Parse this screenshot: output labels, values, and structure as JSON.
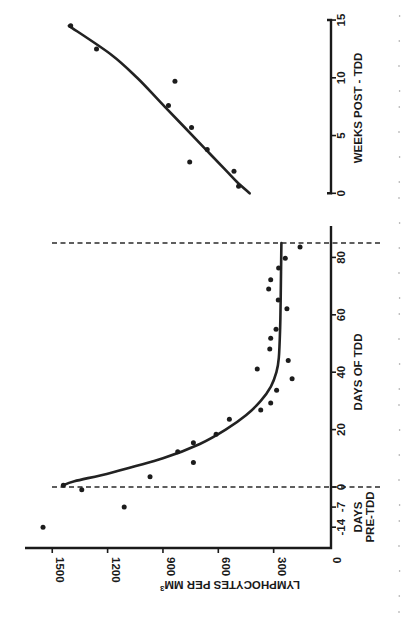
{
  "chart_data": [
    {
      "type": "scatter",
      "panel": "during-tdd",
      "orientation": "rotated 90deg clockwise (y-axis drawn horizontally at bottom)",
      "ylabel": "LYMPHOCYTES PER MM3",
      "ylabel_text": "LYMPHOCYTES PER MM",
      "ylabel_superscript": "3",
      "ylim": [
        0,
        1650
      ],
      "yticks": [
        0,
        300,
        600,
        900,
        1200,
        1500
      ],
      "xlabel": "DAYS OF TDD",
      "xlabel_pre_line1": "DAYS",
      "xlabel_pre_line2": "PRE-TDD",
      "xlim": [
        -16,
        88
      ],
      "xticks": [
        -14,
        -7,
        0,
        20,
        40,
        60,
        80
      ],
      "reference_lines": [
        {
          "axis": "x",
          "value": 0,
          "style": "dashed"
        },
        {
          "axis": "x",
          "value": 85,
          "style": "dashed"
        }
      ],
      "points": [
        {
          "x": -14,
          "y": 1550
        },
        {
          "x": -7,
          "y": 1110
        },
        {
          "x": -1,
          "y": 1340
        },
        {
          "x": 0.6,
          "y": 1440
        },
        {
          "x": 3.6,
          "y": 970
        },
        {
          "x": 8.5,
          "y": 735
        },
        {
          "x": 12.3,
          "y": 820
        },
        {
          "x": 15.4,
          "y": 735
        },
        {
          "x": 18.4,
          "y": 612
        },
        {
          "x": 23.6,
          "y": 540
        },
        {
          "x": 26.8,
          "y": 370
        },
        {
          "x": 29.3,
          "y": 316
        },
        {
          "x": 33.7,
          "y": 284
        },
        {
          "x": 37.7,
          "y": 200
        },
        {
          "x": 41.1,
          "y": 389
        },
        {
          "x": 44.1,
          "y": 221
        },
        {
          "x": 48.1,
          "y": 321
        },
        {
          "x": 51.8,
          "y": 316
        },
        {
          "x": 55,
          "y": 287
        },
        {
          "x": 62.1,
          "y": 228
        },
        {
          "x": 65.2,
          "y": 275
        },
        {
          "x": 69,
          "y": 327
        },
        {
          "x": 72.2,
          "y": 316
        },
        {
          "x": 76.3,
          "y": 273
        },
        {
          "x": 79.7,
          "y": 237
        },
        {
          "x": 83.6,
          "y": 157
        }
      ],
      "fit_curve": [
        {
          "x": 0.6,
          "y": 1440
        },
        {
          "x": 2,
          "y": 1380
        },
        {
          "x": 5,
          "y": 1180
        },
        {
          "x": 10,
          "y": 900
        },
        {
          "x": 15,
          "y": 700
        },
        {
          "x": 20,
          "y": 560
        },
        {
          "x": 25,
          "y": 450
        },
        {
          "x": 30,
          "y": 370
        },
        {
          "x": 35,
          "y": 315
        },
        {
          "x": 40,
          "y": 285
        },
        {
          "x": 45,
          "y": 272
        },
        {
          "x": 55,
          "y": 265
        },
        {
          "x": 65,
          "y": 262
        },
        {
          "x": 75,
          "y": 260
        },
        {
          "x": 85,
          "y": 258
        }
      ]
    },
    {
      "type": "scatter",
      "panel": "post-tdd",
      "orientation": "rotated 90deg clockwise",
      "ylabel": "LYMPHOCYTES PER MM3",
      "ylim": [
        0,
        1650
      ],
      "xlabel": "WEEKS POST - TDD",
      "xlim": [
        0,
        15
      ],
      "xticks": [
        0,
        5,
        10,
        15
      ],
      "points": [
        {
          "x": 0.6,
          "y": 490
        },
        {
          "x": 1.9,
          "y": 515
        },
        {
          "x": 2.7,
          "y": 755
        },
        {
          "x": 3.8,
          "y": 660
        },
        {
          "x": 5.7,
          "y": 745
        },
        {
          "x": 7.6,
          "y": 870
        },
        {
          "x": 9.7,
          "y": 835
        },
        {
          "x": 12.5,
          "y": 1260
        },
        {
          "x": 14.5,
          "y": 1400
        }
      ],
      "fit_curve": [
        {
          "x": 0,
          "y": 430
        },
        {
          "x": 1,
          "y": 500
        },
        {
          "x": 2,
          "y": 560
        },
        {
          "x": 4,
          "y": 680
        },
        {
          "x": 6,
          "y": 800
        },
        {
          "x": 8,
          "y": 920
        },
        {
          "x": 10,
          "y": 1040
        },
        {
          "x": 12,
          "y": 1180
        },
        {
          "x": 14.5,
          "y": 1410
        }
      ]
    }
  ],
  "layout": {
    "val_zero_px": 329,
    "px_per_count": 0.1845,
    "day_zero_py": 487,
    "px_per_day": 2.87,
    "week_axis_x": 331,
    "week_zero_py": 193.3,
    "px_per_week": 11.55,
    "bottom_axis_y": 548,
    "day_axis_top": 226,
    "day_axis_bottom": 548,
    "bottom_axis_left": 25
  }
}
